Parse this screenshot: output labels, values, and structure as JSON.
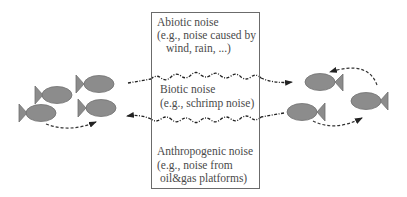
{
  "diagram": {
    "type": "underwater acoustic noise interference diagram",
    "colors": {
      "fish_fill": "#8c8c8c",
      "fish_stroke": "#6e6e6e",
      "box_border": "#6b6b6b",
      "text": "#4a4a4a",
      "arrow": "#333333",
      "noise_line": "#222222"
    },
    "noise_box": {
      "abiotic": {
        "title": "Abiotic noise",
        "desc_line1": "(e.g., noise caused by",
        "desc_line2": "wind, rain, ...)"
      },
      "biotic": {
        "title": "Biotic noise",
        "desc_line1": "(e.g., schrimp noise)"
      },
      "anthropogenic": {
        "title": "Anthropogenic noise",
        "desc_line1": "(e.g., noise from",
        "desc_line2": "oil&gas platforms)"
      }
    },
    "left_school": {
      "fish_count": 4,
      "facing": "right"
    },
    "right_school": {
      "fish_count": 3,
      "facing": "left"
    },
    "signals": [
      {
        "name": "left-to-right signal",
        "direction": "right",
        "style": "dashed with wavy noise"
      },
      {
        "name": "right-to-left signal",
        "direction": "left",
        "style": "dashed with wavy noise"
      }
    ]
  }
}
